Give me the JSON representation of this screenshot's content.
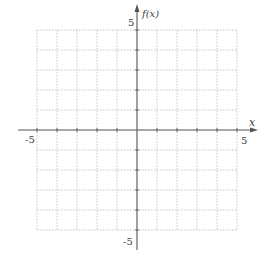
{
  "chart_data": {
    "type": "line",
    "title": "",
    "xlabel": "x",
    "ylabel": "f(x)",
    "xlim": [
      -5,
      5
    ],
    "ylim": [
      -5,
      5
    ],
    "grid": true,
    "grid_step": 1,
    "x_tick_labels": [
      {
        "value": -5,
        "label": "-5"
      },
      {
        "value": 5,
        "label": "5"
      }
    ],
    "y_tick_labels": [
      {
        "value": 5,
        "label": "5"
      },
      {
        "value": -5,
        "label": "-5"
      }
    ],
    "series": []
  },
  "axes": {
    "x_label": "x",
    "y_label": "f(x)",
    "x_min_label": "-5",
    "x_max_label": "5",
    "y_max_label": "5",
    "y_min_label": "-5"
  },
  "colors": {
    "axis": "#555555",
    "grid": "#b8b8b8",
    "text": "#444444"
  }
}
